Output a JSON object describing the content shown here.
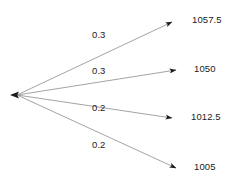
{
  "diagram": {
    "type": "probability-tree",
    "title": "",
    "root": {
      "name": "root-node",
      "x": 16,
      "y": 95
    },
    "line_color": "#808080",
    "arrow_color": "#1a1a1a",
    "text_color": "#222222",
    "background": "#ffffff",
    "branches": [
      {
        "probability": "0.3",
        "outcome": "1057.5",
        "prob_x": 92,
        "prob_y": 35,
        "end_x": 176,
        "end_y": 21,
        "label_x": 194,
        "label_y": 15
      },
      {
        "probability": "0.3",
        "outcome": "1050",
        "prob_x": 92,
        "prob_y": 71,
        "end_x": 180,
        "end_y": 70,
        "label_x": 196,
        "label_y": 64
      },
      {
        "probability": "0.2",
        "outcome": "1012.5",
        "prob_x": 92,
        "prob_y": 108,
        "end_x": 176,
        "end_y": 118,
        "label_x": 192,
        "label_y": 112
      },
      {
        "probability": "0.2",
        "outcome": "1005",
        "prob_x": 92,
        "prob_y": 145,
        "end_x": 180,
        "end_y": 168,
        "label_x": 196,
        "label_y": 162
      }
    ]
  }
}
